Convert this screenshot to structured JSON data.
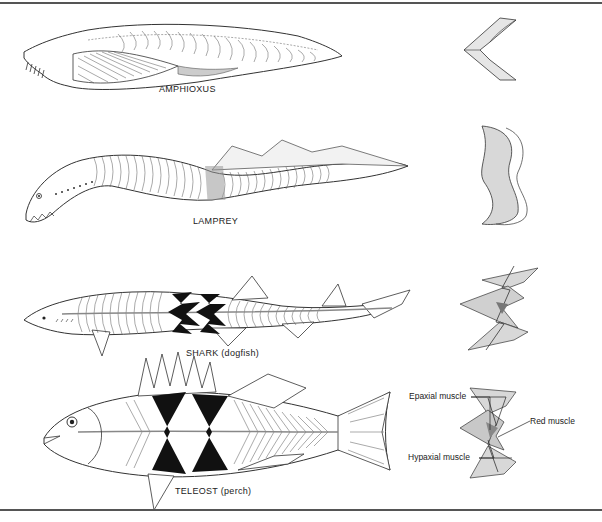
{
  "figure": {
    "rows": [
      {
        "id": "amphioxus",
        "label": "AMPHIOXUS"
      },
      {
        "id": "lamprey",
        "label": "LAMPREY"
      },
      {
        "id": "shark",
        "label": "SHARK (dogfish)"
      },
      {
        "id": "teleost",
        "label": "TELEOST (perch)"
      }
    ],
    "cross_section_annotations": {
      "epaxial": "Epaxial muscle",
      "red": "Red muscle",
      "hypaxial": "Hypaxial muscle"
    }
  }
}
